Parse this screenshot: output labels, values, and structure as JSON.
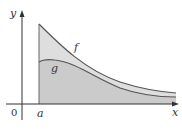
{
  "figure": {
    "axes": {
      "x_label": "x",
      "y_label": "y",
      "origin_label": "0"
    },
    "curves": [
      {
        "name": "f",
        "label": "f",
        "shape": "decreasing, convex, starts high at x=a"
      },
      {
        "name": "g",
        "label": "g",
        "shape": "rises slightly to a hump then decreases below f"
      }
    ],
    "markers": {
      "a_label": "a"
    },
    "colors": {
      "region_between": "#dcdcdc",
      "region_under_g": "#c8c8c8",
      "curve_stroke": "#555555",
      "axis_stroke": "#333333"
    }
  }
}
